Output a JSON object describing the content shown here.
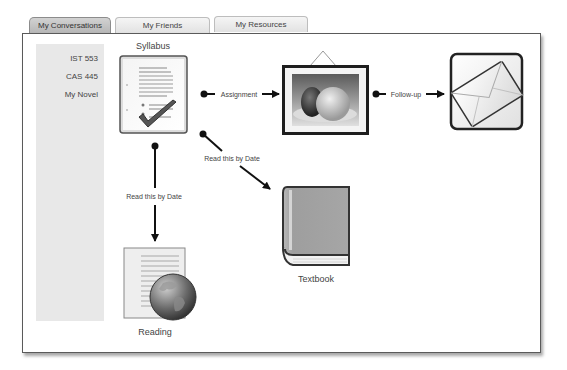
{
  "tabs": [
    {
      "label": "My Conversations",
      "active": true
    },
    {
      "label": "My Friends",
      "active": false
    },
    {
      "label": "My Resources",
      "active": false
    }
  ],
  "sidebar": {
    "items": [
      {
        "label": "IST 553"
      },
      {
        "label": "CAS 445"
      },
      {
        "label": "My Novel"
      }
    ]
  },
  "nodes": {
    "syllabus": {
      "label": "Syllabus",
      "icon": "document-checklist-icon"
    },
    "assignment": {
      "icon": "picture-frame-icon"
    },
    "followup": {
      "icon": "envelope-icon"
    },
    "textbook": {
      "label": "Textbook",
      "icon": "book-icon"
    },
    "reading": {
      "label": "Reading",
      "icon": "document-globe-icon"
    }
  },
  "edges": {
    "assignment": {
      "label": "Assignment"
    },
    "followup": {
      "label": "Follow-up"
    },
    "textbook": {
      "label": "Read this by Date"
    },
    "reading": {
      "label": "Read this by Date"
    }
  },
  "colors": {
    "active_tab": "#c4c4c4",
    "sidebar_bg": "#e8e8e8",
    "panel_border": "#5a5a5a",
    "connector": "#111111"
  }
}
